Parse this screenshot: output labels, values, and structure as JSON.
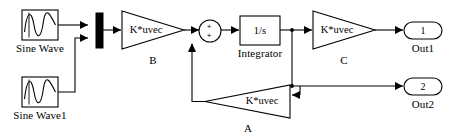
{
  "diagram": {
    "kind": "simulink-block-diagram",
    "background_color": "#ffffff",
    "line_color": "#000000",
    "text_color": "#000000"
  },
  "sources": [
    {
      "id": "sine-wave",
      "label": "Sine Wave",
      "icon": "sine-wave-icon",
      "x": 22,
      "y": 10,
      "w": 36,
      "h": 30,
      "label_x": 40,
      "label_y": 48
    },
    {
      "id": "sine-wave-1",
      "label": "Sine Wave1",
      "icon": "sine-wave-icon",
      "x": 22,
      "y": 77,
      "w": 36,
      "h": 30,
      "label_x": 40,
      "label_y": 115
    }
  ],
  "mux": {
    "id": "mux",
    "name": "mux-block",
    "x": 96,
    "y": 13,
    "w": 7,
    "h": 35
  },
  "gains": [
    {
      "id": "gain-b",
      "expr": "K*uvec",
      "caption": "B",
      "direction": "right",
      "x": 122,
      "y": 11,
      "w": 62,
      "h": 38,
      "caption_x": 153,
      "caption_y": 60
    },
    {
      "id": "gain-c",
      "expr": "K*uvec",
      "caption": "C",
      "direction": "right",
      "x": 313,
      "y": 11,
      "w": 62,
      "h": 38,
      "caption_x": 344,
      "caption_y": 60
    },
    {
      "id": "gain-a",
      "expr": "K*uvec",
      "caption": "A",
      "direction": "left",
      "x": 205,
      "y": 85,
      "w": 85,
      "h": 33,
      "caption_x": 248,
      "caption_y": 128
    }
  ],
  "sum": {
    "id": "sum-block",
    "name": "sum-junction",
    "cx": 210,
    "cy": 31,
    "r": 11,
    "signs": [
      {
        "text": "+",
        "x": 209,
        "y": 27
      },
      {
        "text": "+",
        "x": 209,
        "y": 36
      }
    ]
  },
  "integrator": {
    "id": "integrator",
    "expr": "1/s",
    "label": "Integrator",
    "x": 240,
    "y": 16,
    "w": 40,
    "h": 29,
    "label_x": 260,
    "label_y": 53
  },
  "outputs": [
    {
      "id": "out-1",
      "port_number": "1",
      "label": "Out1",
      "x": 404,
      "y": 22,
      "w": 38,
      "h": 17,
      "label_x": 423,
      "label_y": 48
    },
    {
      "id": "out-2",
      "port_number": "2",
      "label": "Out2",
      "x": 404,
      "y": 78,
      "w": 38,
      "h": 17,
      "label_x": 423,
      "label_y": 104
    }
  ],
  "signals": [
    {
      "id": "sine-wave-to-mux",
      "from": "sine-wave",
      "to": "mux-input-1"
    },
    {
      "id": "sine-wave1-to-mux",
      "from": "sine-wave-1",
      "to": "mux-input-2"
    },
    {
      "id": "mux-to-gain-b",
      "from": "mux",
      "to": "gain-b"
    },
    {
      "id": "gain-b-to-sum",
      "from": "gain-b",
      "to": "sum-block"
    },
    {
      "id": "sum-to-integrator",
      "from": "sum-block",
      "to": "integrator"
    },
    {
      "id": "integrator-to-gain-c",
      "from": "integrator",
      "to": "gain-c"
    },
    {
      "id": "gain-c-to-out1",
      "from": "gain-c",
      "to": "out-1"
    },
    {
      "id": "branch-to-out2",
      "from": "integrator-branch",
      "to": "out-2"
    },
    {
      "id": "branch-to-gain-a",
      "from": "integrator-branch",
      "to": "gain-a"
    },
    {
      "id": "gain-a-to-sum",
      "from": "gain-a",
      "to": "sum-block"
    }
  ],
  "junctions": [
    {
      "id": "junction-integrator-branch",
      "x": 292,
      "y": 30
    },
    {
      "id": "junction-out2-split",
      "x": 292,
      "y": 86
    }
  ]
}
